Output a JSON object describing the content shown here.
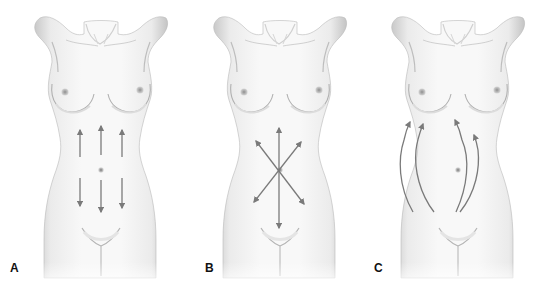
{
  "figure": {
    "panels": [
      {
        "id": "A",
        "label": "A",
        "offset_x": 0,
        "arrow_pattern": "vertical-up-down",
        "label_pos": [
          10,
          262
        ]
      },
      {
        "id": "B",
        "label": "B",
        "offset_x": 179,
        "arrow_pattern": "crossed-star",
        "label_pos": [
          205,
          262
        ]
      },
      {
        "id": "C",
        "label": "C",
        "offset_x": 357,
        "arrow_pattern": "curved-upward",
        "label_pos": [
          374,
          262
        ]
      }
    ],
    "colors": {
      "background": "#ffffff",
      "skin_light": "#f6f6f6",
      "skin_shadow": "#c8c8c8",
      "outline": "#a9a9a9",
      "arrow": "#7a7a7a",
      "label": "#111111"
    }
  }
}
